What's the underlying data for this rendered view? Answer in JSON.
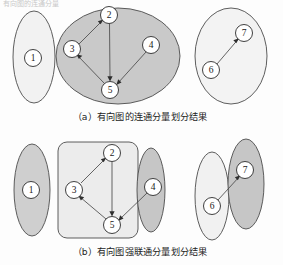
{
  "figure": {
    "top_fragment": "有向图的连通分量",
    "background_color": "#fdfdfd",
    "node_fill": "#ffffff",
    "node_stroke": "#2b2b2b",
    "edge_color": "#4a4a4a"
  },
  "panels": [
    {
      "id": "panel-a",
      "caption": "（a）有向图的连通分量划分结果",
      "caption_prefix": "(a)",
      "caption_chinese": "有向图的连通分量划分结果",
      "regions": [
        {
          "name": "region-a-1",
          "shape": "ellipse",
          "fill": "#f2f2f2",
          "cx": 34,
          "cy": 57,
          "rx": 21,
          "ry": 46,
          "members": [
            "1"
          ]
        },
        {
          "name": "region-a-2345",
          "shape": "ellipse",
          "fill": "#c9c9c9",
          "cx": 118,
          "cy": 56,
          "rx": 62,
          "ry": 48,
          "members": [
            "2",
            "3",
            "4",
            "5"
          ]
        },
        {
          "name": "region-a-67",
          "shape": "ellipse",
          "fill": "#f3f3f3",
          "cx": 231,
          "cy": 56,
          "rx": 36,
          "ry": 48,
          "members": [
            "6",
            "7"
          ]
        }
      ],
      "nodes": [
        {
          "id": "1",
          "label": "1",
          "cx": 33,
          "cy": 58,
          "r": 8.5
        },
        {
          "id": "2",
          "label": "2",
          "cx": 109,
          "cy": 15,
          "r": 8.5
        },
        {
          "id": "3",
          "label": "3",
          "cx": 72,
          "cy": 49,
          "r": 8.5
        },
        {
          "id": "4",
          "label": "4",
          "cx": 151,
          "cy": 45,
          "r": 8.5
        },
        {
          "id": "5",
          "label": "5",
          "cx": 110,
          "cy": 90,
          "r": 8.5
        },
        {
          "id": "6",
          "label": "6",
          "cx": 211,
          "cy": 70,
          "r": 8.5
        },
        {
          "id": "7",
          "label": "7",
          "cx": 244,
          "cy": 33,
          "r": 8.5
        }
      ],
      "edges": [
        {
          "from": "3",
          "to": "2"
        },
        {
          "from": "2",
          "to": "5"
        },
        {
          "from": "5",
          "to": "3"
        },
        {
          "from": "4",
          "to": "5"
        },
        {
          "from": "6",
          "to": "7"
        }
      ]
    },
    {
      "id": "panel-b",
      "caption": "（b）有向图强联通分量划分结果",
      "caption_prefix": "(b)",
      "caption_chinese": "有向图强联通分量划分结果",
      "regions": [
        {
          "name": "region-b-1",
          "shape": "ellipse",
          "fill": "#cfcfcf",
          "cx": 32,
          "cy": 190,
          "rx": 18,
          "ry": 46,
          "members": [
            "1"
          ]
        },
        {
          "name": "region-b-235",
          "shape": "roundrect",
          "fill": "#ececec",
          "x": 58,
          "y": 142,
          "width": 80,
          "height": 96,
          "rx": 9,
          "members": [
            "2",
            "3",
            "5"
          ]
        },
        {
          "name": "region-b-4",
          "shape": "ellipse",
          "fill": "#c6c6c6",
          "cx": 151,
          "cy": 190,
          "rx": 14,
          "ry": 42,
          "members": [
            "4"
          ]
        },
        {
          "name": "region-b-6",
          "shape": "ellipse",
          "fill": "#f1f1f1",
          "cx": 212,
          "cy": 196,
          "rx": 17,
          "ry": 44,
          "members": [
            "6"
          ]
        },
        {
          "name": "region-b-7",
          "shape": "ellipse",
          "fill": "#c6c6c6",
          "cx": 246,
          "cy": 184,
          "rx": 18,
          "ry": 45,
          "members": [
            "7"
          ]
        }
      ],
      "nodes": [
        {
          "id": "1",
          "label": "1",
          "cx": 31,
          "cy": 190,
          "r": 8.5
        },
        {
          "id": "2",
          "label": "2",
          "cx": 112,
          "cy": 153,
          "r": 8.5
        },
        {
          "id": "3",
          "label": "3",
          "cx": 74,
          "cy": 190,
          "r": 8.5
        },
        {
          "id": "4",
          "label": "4",
          "cx": 153,
          "cy": 187,
          "r": 8.5
        },
        {
          "id": "5",
          "label": "5",
          "cx": 112,
          "cy": 225,
          "r": 8.5
        },
        {
          "id": "6",
          "label": "6",
          "cx": 212,
          "cy": 206,
          "r": 8.5
        },
        {
          "id": "7",
          "label": "7",
          "cx": 245,
          "cy": 170,
          "r": 8.5
        }
      ],
      "edges": [
        {
          "from": "3",
          "to": "2"
        },
        {
          "from": "2",
          "to": "5"
        },
        {
          "from": "5",
          "to": "3"
        },
        {
          "from": "4",
          "to": "5"
        },
        {
          "from": "6",
          "to": "7"
        }
      ]
    }
  ],
  "captions": {
    "a": "（a）有向图的连通分量划分结果",
    "a_x": 140,
    "a_y": 116,
    "b": "（b）有向图强联通分量划分结果",
    "b_x": 140,
    "b_y": 251
  }
}
